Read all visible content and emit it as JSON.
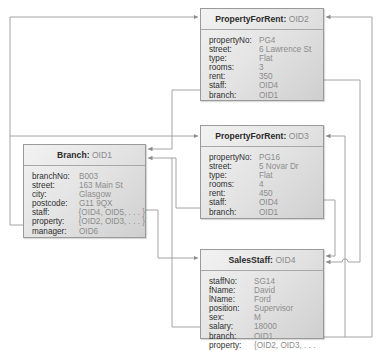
{
  "diagram": {
    "objects": {
      "pfr2": {
        "class_name": "PropertyForRent:",
        "oid": "OID2",
        "attributes": [
          {
            "name": "propertyNo:",
            "value": "PG4"
          },
          {
            "name": "street:",
            "value": "6 Lawrence St"
          },
          {
            "name": "type:",
            "value": "Flat"
          },
          {
            "name": "rooms:",
            "value": "3"
          },
          {
            "name": "rent:",
            "value": "350"
          },
          {
            "name": "staff:",
            "value": "OID4"
          },
          {
            "name": "branch:",
            "value": "OID1"
          }
        ]
      },
      "pfr3": {
        "class_name": "PropertyForRent:",
        "oid": "OID3",
        "attributes": [
          {
            "name": "propertyNo:",
            "value": "PG16"
          },
          {
            "name": "street:",
            "value": "5 Novar Dr"
          },
          {
            "name": "type:",
            "value": "Flat"
          },
          {
            "name": "rooms:",
            "value": "4"
          },
          {
            "name": "rent:",
            "value": "450"
          },
          {
            "name": "staff:",
            "value": "OID4"
          },
          {
            "name": "branch:",
            "value": "OID1"
          }
        ]
      },
      "branch": {
        "class_name": "Branch:",
        "oid": "OID1",
        "attributes": [
          {
            "name": "branchNo:",
            "value": "B003"
          },
          {
            "name": "street:",
            "value": "163 Main St"
          },
          {
            "name": "city:",
            "value": "Glasgow"
          },
          {
            "name": "postcode:",
            "value": "G11 9QX"
          },
          {
            "name": "staff:",
            "value": "{OID4, OID5, . . . }"
          },
          {
            "name": "property:",
            "value": "{OID2, OID3, . . . }"
          },
          {
            "name": "manager:",
            "value": "OID6"
          }
        ]
      },
      "staff": {
        "class_name": "SalesStaff:",
        "oid": "OID4",
        "attributes": [
          {
            "name": "staffNo:",
            "value": "SG14"
          },
          {
            "name": "fName:",
            "value": "David"
          },
          {
            "name": "lName:",
            "value": "Ford"
          },
          {
            "name": "position:",
            "value": "Supervisor"
          },
          {
            "name": "sex:",
            "value": "M"
          },
          {
            "name": "salary:",
            "value": "18000"
          },
          {
            "name": "branch:",
            "value": "OID1"
          },
          {
            "name": "property:",
            "value": "{OID2, OID3, . . ."
          }
        ]
      }
    },
    "colors": {
      "line": "#8a8a8a",
      "box_border": "#9a9a9a",
      "key_text": "#2f2f2f",
      "value_text": "#8c8c8c"
    }
  }
}
